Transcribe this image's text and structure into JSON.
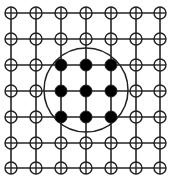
{
  "diagram": {
    "type": "grid-lattice",
    "rows": 7,
    "cols": 7,
    "x_positions": [
      11,
      36,
      61,
      86,
      111,
      136,
      160
    ],
    "y_positions": [
      13,
      39,
      65,
      91,
      117,
      143,
      168
    ],
    "node_radius": 6,
    "line_color": "#222222",
    "node_stroke": "#222222",
    "node_fill_open": "#ffffff",
    "node_fill_filled": "#000000",
    "filled_nodes": [
      [
        2,
        2
      ],
      [
        2,
        3
      ],
      [
        2,
        4
      ],
      [
        3,
        2
      ],
      [
        3,
        3
      ],
      [
        3,
        4
      ],
      [
        4,
        2
      ],
      [
        4,
        3
      ],
      [
        4,
        4
      ]
    ],
    "open_node_glyph": "circle-with-cross",
    "enclosing_circle": {
      "cx": 86,
      "cy": 90,
      "r": 42,
      "stroke": "#222222"
    }
  }
}
